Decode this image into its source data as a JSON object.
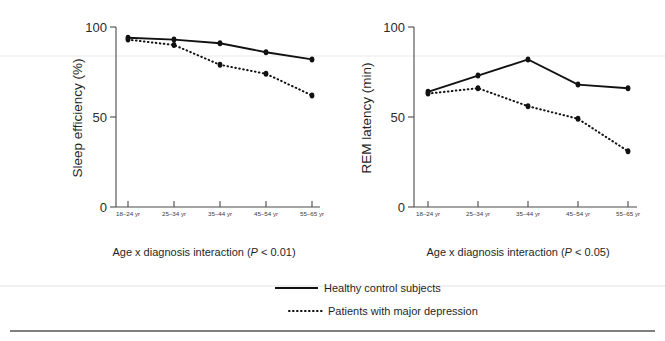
{
  "figure": {
    "width": 665,
    "height": 341,
    "background": "#ffffff",
    "ink_color": "#111111"
  },
  "panels": [
    {
      "id": "sleep-efficiency",
      "caption": "Age x diagnosis interaction (",
      "caption_italic": "P",
      "caption_tail": " < 0.01)",
      "caption_full": "Age x diagnosis interaction (P < 0.01)"
    },
    {
      "id": "rem-latency",
      "caption": "Age x diagnosis interaction (",
      "caption_italic": "P",
      "caption_tail": " < 0.05)",
      "caption_full": "Age x diagnosis interaction (P < 0.05)"
    }
  ],
  "legend": {
    "position": "bottom-center",
    "entries": [
      {
        "label": "Healthy control subjects",
        "style": "solid"
      },
      {
        "label": "Patients with major depression",
        "style": "dotted"
      }
    ]
  },
  "chart_data": [
    {
      "type": "line",
      "id": "sleep-efficiency",
      "title": "",
      "xlabel": "",
      "ylabel": "Sleep efficiency  (%)",
      "categories": [
        "18–24 yr",
        "25–34 yr",
        "35–44 yr",
        "45–54 yr",
        "55–65 yr"
      ],
      "yticks": [
        0,
        50,
        100
      ],
      "ylim": [
        0,
        100
      ],
      "grid": false,
      "legend_position": "bottom",
      "annotations": [
        "Age x diagnosis interaction (P < 0.01)"
      ],
      "series": [
        {
          "name": "Healthy control subjects",
          "style": "solid",
          "values": [
            94,
            93,
            91,
            86,
            82
          ]
        },
        {
          "name": "Patients with major depression",
          "style": "dotted",
          "values": [
            93,
            90,
            79,
            74,
            62
          ]
        }
      ]
    },
    {
      "type": "line",
      "id": "rem-latency",
      "title": "",
      "xlabel": "",
      "ylabel": "REM latency (min)",
      "categories": [
        "18–24 yr",
        "25–34 yr",
        "35–44 yr",
        "45–54 yr",
        "55–65 yr"
      ],
      "yticks": [
        0,
        50,
        100
      ],
      "ylim": [
        0,
        100
      ],
      "grid": false,
      "legend_position": "bottom",
      "annotations": [
        "Age x diagnosis interaction (P < 0.05)"
      ],
      "series": [
        {
          "name": "Healthy control subjects",
          "style": "solid",
          "values": [
            64,
            73,
            82,
            68,
            66
          ]
        },
        {
          "name": "Patients with major depression",
          "style": "dotted",
          "values": [
            63,
            66,
            56,
            49,
            31
          ]
        }
      ]
    }
  ],
  "axis_text": {
    "left_ylabel": "Sleep efficiency  (%)",
    "right_ylabel": "REM latency (min)",
    "ytick_top": "100",
    "ytick_mid": "50",
    "ytick_bottom": "0"
  }
}
